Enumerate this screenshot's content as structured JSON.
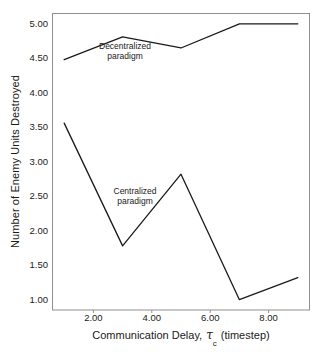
{
  "chart_data": {
    "type": "line",
    "title": "",
    "subtitle": "",
    "xlabel": "Communication Delay,",
    "xlabel_symbol": "τ",
    "xlabel_subscript": "c",
    "xlabel_units": "(timestep)",
    "ylabel": "Number of Enemy Units Destroyed",
    "x": [
      1,
      3,
      5,
      7,
      9
    ],
    "xlim": [
      0.6,
      9.4
    ],
    "ylim": [
      0.85,
      5.15
    ],
    "xticks": [
      2,
      4,
      6,
      8
    ],
    "xticklabels": [
      "2.00",
      "4.00",
      "6.00",
      "8.00"
    ],
    "yticks": [
      1.0,
      1.5,
      2.0,
      2.5,
      3.0,
      3.5,
      4.0,
      4.5,
      5.0
    ],
    "yticklabels": [
      "1.00",
      "1.50",
      "2.00",
      "2.50",
      "3.00",
      "3.50",
      "4.00",
      "4.50",
      "5.00"
    ],
    "grid": false,
    "legend_position": "inline-annotations",
    "line_color": "#1a1a1a",
    "background_color": "#ffffff",
    "series": [
      {
        "name": "Decentralized paradigm",
        "values": [
          4.48,
          4.81,
          4.65,
          5.0,
          5.0
        ]
      },
      {
        "name": "Centralized paradigm",
        "values": [
          3.56,
          1.78,
          2.82,
          1.0,
          1.32
        ]
      }
    ],
    "annotations": [
      {
        "text": "Decentralized\nparadigm",
        "series": "Decentralized paradigm"
      },
      {
        "text": "Centralized\nparadigm",
        "series": "Centralized paradigm"
      }
    ]
  }
}
